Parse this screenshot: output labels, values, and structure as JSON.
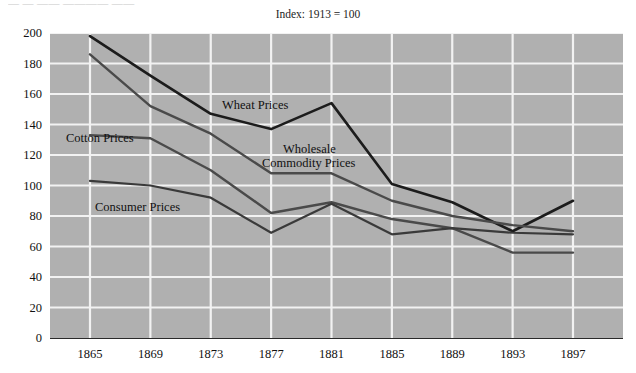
{
  "top_fragment": "— — —— ———— ——",
  "note": "Index: 1913 = 100",
  "chart_data": {
    "type": "line",
    "title": "Index: 1913 = 100",
    "subtitle": "",
    "xlabel": "",
    "ylabel": "",
    "x": [
      1865,
      1869,
      1873,
      1877,
      1881,
      1885,
      1889,
      1893,
      1897
    ],
    "categories": [
      "1865",
      "1869",
      "1873",
      "1877",
      "1881",
      "1885",
      "1889",
      "1893",
      "1897"
    ],
    "xlim": [
      1865,
      1897
    ],
    "ylim": [
      0,
      200
    ],
    "ytick_values": [
      0,
      20,
      40,
      60,
      80,
      100,
      120,
      140,
      160,
      180,
      200
    ],
    "ytick_labels": [
      "0",
      "20",
      "40",
      "60",
      "80",
      "100",
      "120",
      "140",
      "160",
      "180",
      "200"
    ],
    "xtick_labels": [
      "1865",
      "1869",
      "1873",
      "1877",
      "1881",
      "1885",
      "1889",
      "1893",
      "1897"
    ],
    "grid": true,
    "grid_color": "#f2f2f2",
    "plot_background": "#b0b0b0",
    "legend": "inline-annotations",
    "series": [
      {
        "name": "Wheat Prices",
        "color": "#1c1c1c",
        "width": 2.6,
        "values": [
          198,
          172,
          147,
          137,
          154,
          101,
          89,
          70,
          90
        ]
      },
      {
        "name": "Cotton Prices",
        "color": "#4a4a4a",
        "width": 2.4,
        "values": [
          186,
          152,
          134,
          108,
          108,
          90,
          80,
          74,
          70
        ]
      },
      {
        "name": "Wholesale Commodity Prices",
        "color": "#4a4a4a",
        "width": 2.4,
        "values": [
          133,
          131,
          110,
          82,
          89,
          78,
          72,
          56,
          56
        ]
      },
      {
        "name": "Consumer Prices",
        "color": "#3a3a3a",
        "width": 2.2,
        "values": [
          103,
          100,
          92,
          69,
          88,
          68,
          72,
          69,
          68
        ]
      }
    ],
    "annotations": [
      {
        "text": "Wheat Prices",
        "series": "Wheat Prices",
        "x": 222,
        "y": 98
      },
      {
        "text": "Cotton Prices",
        "series": "Cotton Prices",
        "x": 66,
        "y": 131
      },
      {
        "text": "Wholesale",
        "series": "Wholesale Commodity Prices",
        "x": 283,
        "y": 142
      },
      {
        "text": "Commodity Prices",
        "series": "Wholesale Commodity Prices",
        "x": 262,
        "y": 156
      },
      {
        "text": "Consumer Prices",
        "series": "Consumer Prices",
        "x": 95,
        "y": 200
      }
    ]
  }
}
